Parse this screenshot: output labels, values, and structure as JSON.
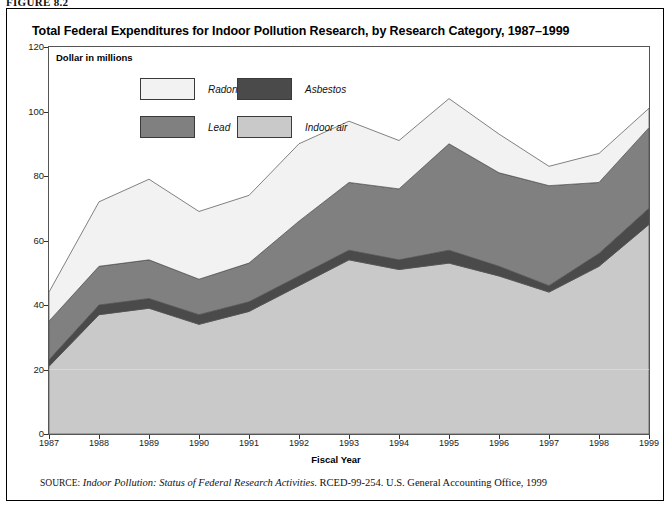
{
  "figure": {
    "label": "FIGURE 8.2",
    "title": "Total Federal Expenditures for Indoor Pollution Research, by Research Category, 1987–1999",
    "axis_note": "Dollar in millions",
    "source_lead": "SOURCE:",
    "source_title": "Indoor Pollution: Status of Federal Research Activities",
    "source_rest": ". RCED-99-254. U.S. General Accounting Office, 1999"
  },
  "legend": {
    "items": [
      {
        "label": "Radon",
        "color": "#f2f2f2",
        "key": "radon"
      },
      {
        "label": "Asbestos",
        "color": "#4a4a4a",
        "key": "asbestos"
      },
      {
        "label": "Lead",
        "color": "#808080",
        "key": "lead"
      },
      {
        "label": "Indoor air",
        "color": "#c9c9c9",
        "key": "indoor_air"
      }
    ]
  },
  "chart_data": {
    "type": "area",
    "stacked": true,
    "title": "Total Federal Expenditures for Indoor Pollution Research, by Research Category, 1987–1999",
    "xlabel": "Fiscal Year",
    "ylabel": "Dollar in millions",
    "xlim": [
      1987,
      1999
    ],
    "ylim": [
      0,
      120
    ],
    "yticks": [
      0,
      20,
      40,
      60,
      80,
      100,
      120
    ],
    "grid": false,
    "legend_position": "inside-top-left",
    "categories": [
      1987,
      1988,
      1989,
      1990,
      1991,
      1992,
      1993,
      1994,
      1995,
      1996,
      1997,
      1998,
      1999
    ],
    "stack_order_bottom_to_top": [
      "indoor_air",
      "asbestos",
      "lead",
      "radon"
    ],
    "series": [
      {
        "name": "Indoor air",
        "key": "indoor_air",
        "color": "#c9c9c9",
        "values": [
          21,
          37,
          39,
          34,
          38,
          46,
          54,
          51,
          53,
          49,
          44,
          52,
          65
        ]
      },
      {
        "name": "Asbestos",
        "key": "asbestos",
        "color": "#4a4a4a",
        "values": [
          2,
          3,
          3,
          3,
          3,
          3,
          3,
          3,
          4,
          3,
          2,
          4,
          5
        ]
      },
      {
        "name": "Lead",
        "key": "lead",
        "color": "#808080",
        "values": [
          12,
          12,
          12,
          11,
          12,
          17,
          21,
          22,
          33,
          29,
          31,
          22,
          25
        ]
      },
      {
        "name": "Radon",
        "key": "radon",
        "color": "#f2f2f2",
        "values": [
          9,
          20,
          25,
          21,
          21,
          24,
          19,
          15,
          14,
          12,
          6,
          9,
          6
        ]
      }
    ],
    "cumulative_tops": {
      "indoor_air": [
        21,
        37,
        39,
        34,
        38,
        46,
        54,
        51,
        53,
        49,
        44,
        52,
        65
      ],
      "asbestos": [
        23,
        40,
        42,
        37,
        41,
        49,
        57,
        54,
        57,
        52,
        46,
        56,
        70
      ],
      "lead": [
        35,
        52,
        54,
        48,
        53,
        66,
        78,
        76,
        90,
        81,
        77,
        78,
        95
      ],
      "radon": [
        44,
        72,
        79,
        69,
        74,
        90,
        97,
        91,
        104,
        93,
        83,
        87,
        101
      ]
    },
    "totals": [
      44,
      72,
      79,
      69,
      74,
      90,
      97,
      91,
      104,
      93,
      83,
      87,
      101
    ]
  }
}
